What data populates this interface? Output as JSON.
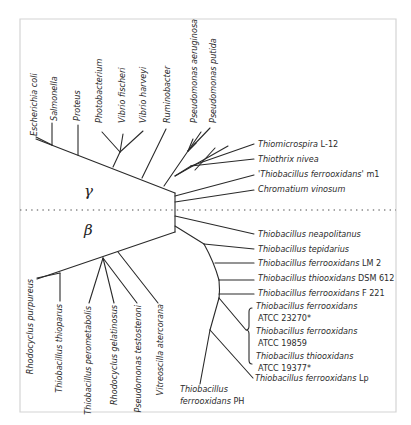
{
  "figure": {
    "type": "phylogenetic-tree",
    "groups": {
      "gamma": "γ",
      "beta": "β"
    }
  },
  "gamma_top": [
    {
      "name": "Escherichia coli",
      "strain": ""
    },
    {
      "name": "Salmonella",
      "strain": ""
    },
    {
      "name": "Proteus",
      "strain": ""
    },
    {
      "name": "Photobacterium",
      "strain": ""
    },
    {
      "name": "Vibrio fischeri",
      "strain": ""
    },
    {
      "name": "Vibrio harveyi",
      "strain": ""
    },
    {
      "name": "Ruminobacter",
      "strain": ""
    },
    {
      "name": "Pseudomonas aeruginosa",
      "strain": ""
    },
    {
      "name": "Pseudomonas putida",
      "strain": ""
    }
  ],
  "gamma_right": [
    {
      "name": "Thiomicrospira",
      "strain": " L-12"
    },
    {
      "name": "Thiothrix nivea",
      "strain": ""
    },
    {
      "name": "'Thiobacillus ferrooxidans'",
      "strain": " m1"
    },
    {
      "name": "Chromatium vinosum",
      "strain": ""
    }
  ],
  "beta_right": [
    {
      "name": "Thiobacillus neapolitanus",
      "strain": ""
    },
    {
      "name": "Thiobacillus tepidarius",
      "strain": ""
    },
    {
      "name": "Thiobacillus ferrooxidans",
      "strain": " LM 2"
    },
    {
      "name": "Thiobacillus thiooxidans",
      "strain": " DSM 612"
    },
    {
      "name": "Thiobacillus ferrooxidans",
      "strain": " F 221"
    }
  ],
  "beta_bracket": [
    {
      "name": "Thiobacillus ferrooxidans",
      "strain": "ATCC 23270*"
    },
    {
      "name": "Thiobacillus ferrooxidans",
      "strain": "ATCC 19859"
    },
    {
      "name": "Thiobacillus thiooxidans",
      "strain": "ATCC 19377*"
    }
  ],
  "beta_lp": {
    "name": "Thiobacillus ferrooxidans",
    "strain": " Lp"
  },
  "beta_ph": {
    "line1": "Thiobacillus",
    "line2_name": "ferrooxidans",
    "line2_strain": " PH"
  },
  "beta_bottom": [
    {
      "name": "Rhodocyclus purpureus"
    },
    {
      "name": "Thiobacillus thioparus"
    },
    {
      "name": "Thiobacillus  perometabolis"
    },
    {
      "name": "Rhodocyclus gelatinosus"
    },
    {
      "name": "Pseudomonas  testosteroni"
    },
    {
      "name": "Vitreoscilla atercorana"
    }
  ]
}
